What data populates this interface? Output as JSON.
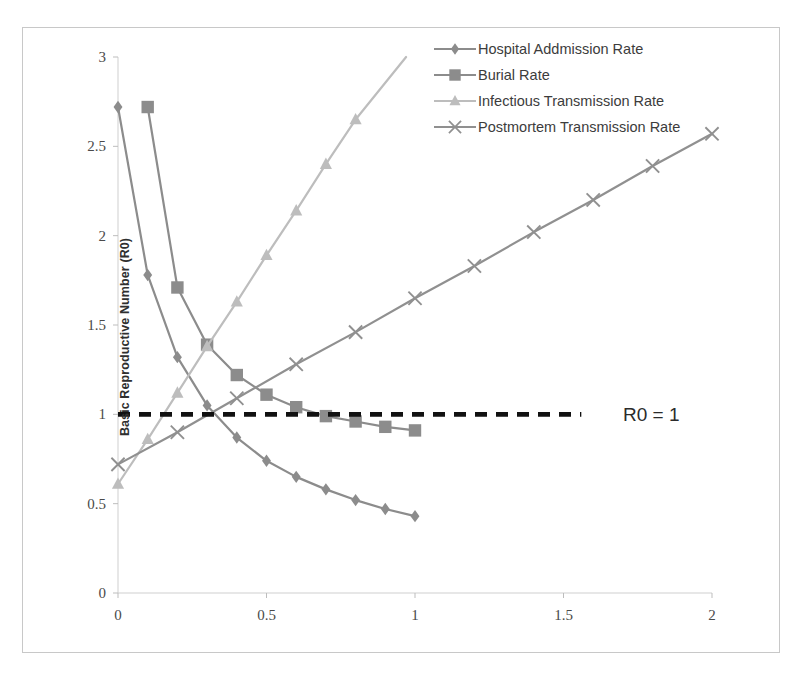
{
  "chart_data": {
    "type": "line",
    "title": "",
    "xlabel": "",
    "ylabel": "Basic Reproductive Number (R0)",
    "xlim": [
      0,
      2
    ],
    "ylim": [
      0,
      3
    ],
    "xticks": [
      "0",
      "0.5",
      "1",
      "1.5",
      "2"
    ],
    "xtick_values": [
      0,
      0.5,
      1,
      1.5,
      2
    ],
    "yticks": [
      "0",
      "0.5",
      "1",
      "1.5",
      "2",
      "2.5",
      "3"
    ],
    "ytick_values": [
      0,
      0.5,
      1,
      1.5,
      2,
      2.5,
      3
    ],
    "grid": false,
    "legend_position": "top-right",
    "annotations": [
      {
        "text": "R0 = 1",
        "x": 1.7,
        "y": 1.0
      }
    ],
    "reference_lines": [
      {
        "label": "R0 = 1",
        "y": 1.0,
        "style": "dashed",
        "color": "#111111",
        "x_start": 0.0,
        "x_end": 1.56
      }
    ],
    "series": [
      {
        "name": "Hospital Addmission Rate",
        "marker": "diamond",
        "color": "#8c8c8c",
        "points": [
          {
            "x": 0.0,
            "y": 2.72
          },
          {
            "x": 0.1,
            "y": 1.78
          },
          {
            "x": 0.2,
            "y": 1.32
          },
          {
            "x": 0.3,
            "y": 1.05
          },
          {
            "x": 0.4,
            "y": 0.87
          },
          {
            "x": 0.5,
            "y": 0.74
          },
          {
            "x": 0.6,
            "y": 0.65
          },
          {
            "x": 0.7,
            "y": 0.58
          },
          {
            "x": 0.8,
            "y": 0.52
          },
          {
            "x": 0.9,
            "y": 0.47
          },
          {
            "x": 1.0,
            "y": 0.43
          }
        ]
      },
      {
        "name": "Burial Rate",
        "marker": "square",
        "color": "#8c8c8c",
        "points": [
          {
            "x": 0.1,
            "y": 2.72
          },
          {
            "x": 0.2,
            "y": 1.71
          },
          {
            "x": 0.3,
            "y": 1.39
          },
          {
            "x": 0.4,
            "y": 1.22
          },
          {
            "x": 0.5,
            "y": 1.11
          },
          {
            "x": 0.6,
            "y": 1.04
          },
          {
            "x": 0.7,
            "y": 0.99
          },
          {
            "x": 0.8,
            "y": 0.96
          },
          {
            "x": 0.9,
            "y": 0.93
          },
          {
            "x": 1.0,
            "y": 0.91
          }
        ]
      },
      {
        "name": "Infectious Transmission Rate",
        "marker": "triangle",
        "color": "#bdbdbd",
        "points": [
          {
            "x": 0.0,
            "y": 0.61
          },
          {
            "x": 0.1,
            "y": 0.86
          },
          {
            "x": 0.2,
            "y": 1.12
          },
          {
            "x": 0.3,
            "y": 1.38
          },
          {
            "x": 0.4,
            "y": 1.63
          },
          {
            "x": 0.5,
            "y": 1.89
          },
          {
            "x": 0.6,
            "y": 2.14
          },
          {
            "x": 0.7,
            "y": 2.4
          },
          {
            "x": 0.8,
            "y": 2.65
          },
          {
            "x": 0.97,
            "y": 3.0
          }
        ]
      },
      {
        "name": "Postmortem Transmission Rate",
        "marker": "cross",
        "color": "#909090",
        "points": [
          {
            "x": 0.0,
            "y": 0.72
          },
          {
            "x": 0.2,
            "y": 0.9
          },
          {
            "x": 0.4,
            "y": 1.09
          },
          {
            "x": 0.6,
            "y": 1.28
          },
          {
            "x": 0.8,
            "y": 1.46
          },
          {
            "x": 1.0,
            "y": 1.65
          },
          {
            "x": 1.2,
            "y": 1.83
          },
          {
            "x": 1.4,
            "y": 2.02
          },
          {
            "x": 1.6,
            "y": 2.2
          },
          {
            "x": 1.8,
            "y": 2.39
          },
          {
            "x": 2.0,
            "y": 2.57
          }
        ]
      }
    ]
  },
  "legend": {
    "items": [
      {
        "label": "Hospital Addmission Rate",
        "marker": "diamond",
        "color": "#8c8c8c"
      },
      {
        "label": "Burial Rate",
        "marker": "square",
        "color": "#8c8c8c"
      },
      {
        "label": "Infectious Transmission Rate",
        "marker": "triangle",
        "color": "#bdbdbd"
      },
      {
        "label": "Postmortem Transmission Rate",
        "marker": "cross",
        "color": "#909090"
      }
    ]
  },
  "axes": {
    "y_title": "Basic Reproductive Number (R0)"
  },
  "annotation": {
    "r0_label": "R0 = 1"
  }
}
